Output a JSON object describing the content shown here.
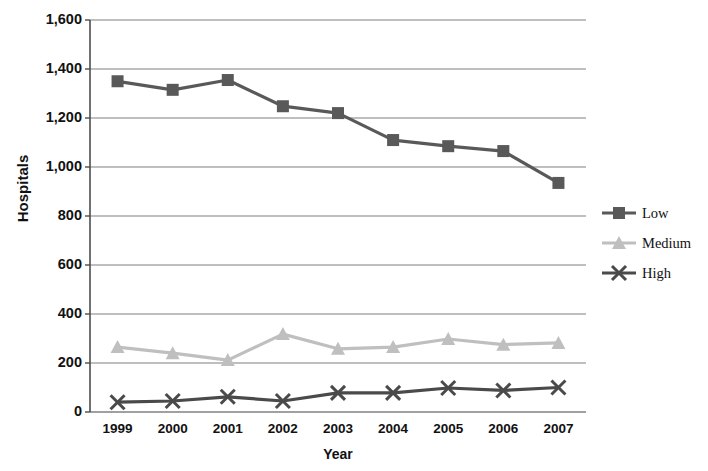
{
  "chart_data": {
    "type": "line",
    "title": "",
    "xlabel": "Year",
    "ylabel": "Hospitals",
    "categories": [
      "1999",
      "2000",
      "2001",
      "2002",
      "2003",
      "2004",
      "2005",
      "2006",
      "2007"
    ],
    "series": [
      {
        "name": "Low",
        "marker": "square",
        "color": "#595959",
        "values": [
          1350,
          1315,
          1355,
          1248,
          1220,
          1110,
          1085,
          1065,
          935
        ]
      },
      {
        "name": "Medium",
        "marker": "triangle",
        "color": "#bfbfbf",
        "values": [
          265,
          240,
          212,
          318,
          258,
          265,
          298,
          275,
          282
        ]
      },
      {
        "name": "High",
        "marker": "x",
        "color": "#4a4a4a",
        "values": [
          40,
          45,
          62,
          45,
          78,
          78,
          98,
          88,
          100
        ]
      }
    ],
    "ylim": [
      0,
      1600
    ],
    "yticks": [
      0,
      200,
      400,
      600,
      800,
      1000,
      1200,
      1400,
      1600
    ],
    "ytick_labels": [
      "0",
      "200",
      "400",
      "600",
      "800",
      "1,000",
      "1,200",
      "1,400",
      "1,600"
    ],
    "grid": true,
    "grid_axis": "y",
    "legend_position": "right",
    "legend_entries": [
      "Low",
      "Medium",
      "High"
    ]
  },
  "colors": {
    "gridline": "#808080",
    "axis": "#4d4d4d",
    "background": "#ffffff",
    "low": "#595959",
    "medium": "#bfbfbf",
    "high": "#4a4a4a"
  }
}
